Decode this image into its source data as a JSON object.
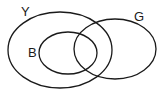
{
  "diagram": {
    "type": "venn",
    "stroke_color": "#1a1a1a",
    "background": "#ffffff",
    "sets": [
      {
        "id": "Y",
        "label": "Y",
        "cx": 60,
        "cy": 50,
        "rx": 52,
        "ry": 38,
        "label_x": 21,
        "label_y": 16
      },
      {
        "id": "B",
        "label": "B",
        "cx": 68,
        "cy": 53,
        "rx": 29,
        "ry": 21,
        "label_x": 28,
        "label_y": 57
      },
      {
        "id": "G",
        "label": "G",
        "cx": 115,
        "cy": 49,
        "rx": 41,
        "ry": 30,
        "label_x": 134,
        "label_y": 21
      }
    ],
    "relations": {
      "B_subset_of": "Y",
      "G_overlaps": [
        "Y",
        "B"
      ]
    }
  }
}
